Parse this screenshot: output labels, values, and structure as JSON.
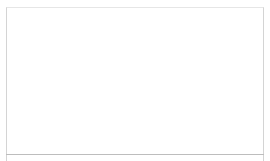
{
  "viewport": {
    "label": "3D viewport",
    "grid": {
      "color": "#d9d9d9",
      "control_points": [
        {
          "x": 84,
          "y": 38,
          "selected": false
        },
        {
          "x": 49,
          "y": 51,
          "selected": false
        },
        {
          "x": 107,
          "y": 53,
          "selected": false
        },
        {
          "x": 10,
          "y": 66,
          "selected": false
        },
        {
          "x": 133,
          "y": 68,
          "selected": false
        },
        {
          "x": 30,
          "y": 83,
          "selected": true
        },
        {
          "x": 98,
          "y": 84,
          "selected": false
        },
        {
          "x": 55,
          "y": 102,
          "selected": false
        }
      ]
    },
    "gizmo": {
      "icon": "transform-gizmo-icon",
      "center": {
        "x": 71,
        "y": 68
      }
    },
    "object": {
      "icon": "helix-ribbon-icon",
      "stroke": "#1a1a1a",
      "start": {
        "x": 50,
        "y": 130
      },
      "end": {
        "x": 245,
        "y": 42
      },
      "twists": 5
    }
  }
}
